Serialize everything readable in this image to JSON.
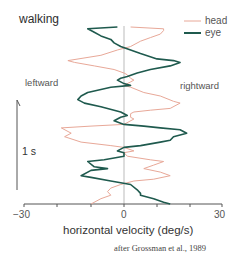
{
  "chart_data": {
    "type": "line",
    "title": "walking",
    "orientation": "vertical time axis (time runs upward), horizontal velocity on x",
    "xlabel": "horizontal velocity (deg/s)",
    "ylabel": "time",
    "xlim": [
      -30,
      30
    ],
    "x_ticks": [
      -30,
      -20,
      -10,
      0,
      10,
      20,
      30
    ],
    "x_tick_labels": [
      "-30",
      "0",
      "30"
    ],
    "time_scale_bar": "1 s",
    "direction_labels": {
      "left": "leftward",
      "right": "rightward"
    },
    "legend": [
      "head",
      "eye"
    ],
    "legend_position": "upper right",
    "grid": false,
    "annotation": "after Grossman et al., 1989",
    "colors": {
      "head": "#e8a898",
      "eye": "#1f5a4e",
      "axis": "#555555",
      "zero_line": "#bbbbbb"
    },
    "series": [
      {
        "name": "eye",
        "note": "points listed top (later time) to bottom (earlier time); x = velocity deg/s, t = fraction of trace height from top",
        "x": [
          -2,
          -11,
          -9,
          -7,
          -4,
          -3,
          -1,
          2,
          5,
          10,
          15,
          17,
          14,
          8,
          4,
          1,
          -1,
          -2,
          0,
          2,
          -4,
          -11,
          -13,
          -14,
          -12,
          -7,
          -3,
          -1,
          1,
          -1,
          -3,
          0,
          6,
          11,
          17,
          19,
          15,
          14,
          11,
          5,
          0,
          -2,
          0,
          0,
          -6,
          -11,
          -9,
          -5,
          -10,
          -13,
          -10,
          -4,
          2,
          4,
          5,
          5,
          9,
          12,
          14
        ],
        "t": [
          0.0,
          0.01,
          0.03,
          0.05,
          0.07,
          0.09,
          0.11,
          0.13,
          0.15,
          0.18,
          0.19,
          0.2,
          0.22,
          0.24,
          0.26,
          0.28,
          0.29,
          0.3,
          0.32,
          0.33,
          0.34,
          0.37,
          0.39,
          0.41,
          0.43,
          0.45,
          0.47,
          0.48,
          0.5,
          0.51,
          0.53,
          0.55,
          0.56,
          0.57,
          0.58,
          0.6,
          0.62,
          0.64,
          0.65,
          0.67,
          0.68,
          0.7,
          0.71,
          0.73,
          0.75,
          0.76,
          0.79,
          0.8,
          0.81,
          0.84,
          0.85,
          0.87,
          0.89,
          0.92,
          0.94,
          0.95,
          0.97,
          0.99,
          1.0
        ]
      },
      {
        "name": "head",
        "note": "points listed top (later time) to bottom (earlier time)",
        "x": [
          2,
          12,
          12,
          11,
          8,
          5,
          2,
          -2,
          -7,
          -17,
          -15,
          -9,
          -3,
          0,
          1,
          2,
          3,
          2,
          0,
          2,
          6,
          11,
          15,
          17,
          14,
          8,
          3,
          2,
          2,
          3,
          0,
          -10,
          -19,
          -16,
          -18,
          -13,
          -4,
          0,
          3,
          0,
          1,
          8,
          12,
          9,
          6,
          11,
          14,
          9,
          3,
          -1,
          -4,
          -5,
          -4,
          -7,
          -10
        ],
        "t": [
          0.0,
          0.01,
          0.02,
          0.04,
          0.06,
          0.08,
          0.11,
          0.13,
          0.16,
          0.19,
          0.2,
          0.22,
          0.24,
          0.26,
          0.27,
          0.29,
          0.3,
          0.31,
          0.33,
          0.34,
          0.37,
          0.39,
          0.42,
          0.43,
          0.46,
          0.47,
          0.48,
          0.49,
          0.51,
          0.52,
          0.55,
          0.56,
          0.57,
          0.6,
          0.62,
          0.65,
          0.67,
          0.68,
          0.7,
          0.71,
          0.73,
          0.75,
          0.76,
          0.78,
          0.8,
          0.82,
          0.84,
          0.86,
          0.87,
          0.89,
          0.91,
          0.93,
          0.95,
          0.97,
          1.0
        ]
      }
    ]
  },
  "labels": {
    "title": "walking",
    "leftward": "leftward",
    "rightward": "rightward",
    "time_scale": "1 s",
    "tick_neg": "−30",
    "tick_zero": "0",
    "tick_pos": "30",
    "xlabel": "horizontal velocity (deg/s)",
    "credit": "after Grossman et al., 1989",
    "legend_head": "head",
    "legend_eye": "eye"
  }
}
